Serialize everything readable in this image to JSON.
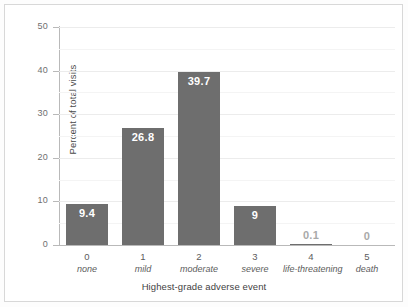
{
  "chart_data": {
    "type": "bar",
    "title": "",
    "xlabel": "Highest-grade adverse event",
    "ylabel": "Percent of total visits",
    "categories": [
      "0",
      "1",
      "2",
      "3",
      "4",
      "5"
    ],
    "category_names": [
      "none",
      "mild",
      "moderate",
      "severe",
      "life-threatening",
      "death"
    ],
    "values": [
      9.4,
      26.8,
      39.7,
      9,
      0.1,
      0
    ],
    "value_labels": [
      "9.4",
      "26.8",
      "39.7",
      "9",
      "0.1",
      "0"
    ],
    "ylim": [
      0,
      50
    ],
    "yticks": [
      0,
      10,
      20,
      30,
      40,
      50
    ],
    "ytick_labels": [
      "0",
      "10",
      "20",
      "30",
      "40",
      "50"
    ],
    "minor_yticks": [
      5,
      15,
      25,
      35,
      45
    ],
    "grid": true,
    "legend": "none",
    "bar_color": "#6e6e6e",
    "inside_label_color": "#ffffff",
    "outside_label_color": "#a9a9a9",
    "background_color": "#ffffff",
    "axis_color": "#b9b9b9",
    "gridline_color": "#ececec"
  }
}
